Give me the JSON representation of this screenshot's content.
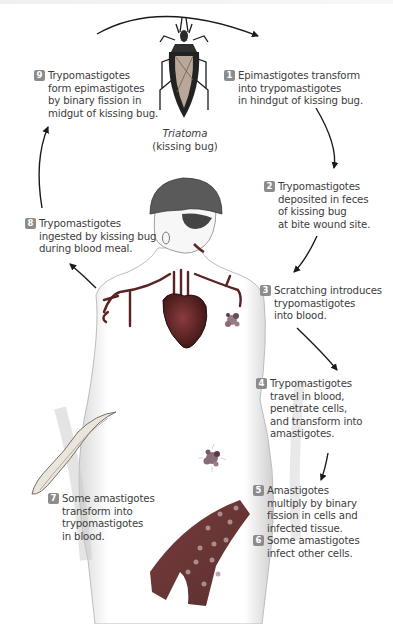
{
  "diagram": {
    "badge_color": "#8c8c8c",
    "arrow_color": "#1a1a1a",
    "bug_caption": {
      "genus": "Triatoma",
      "common_name": "(kissing bug)"
    },
    "steps": [
      {
        "number": "1",
        "lines": [
          "Epimastigotes transform",
          "into trypomastigotes",
          "in hindgut of kissing bug."
        ]
      },
      {
        "number": "2",
        "lines": [
          "Trypomastigotes",
          "deposited in feces",
          "of kissing bug",
          "at bite wound site."
        ]
      },
      {
        "number": "3",
        "lines": [
          "Scratching introduces",
          "trypomastigotes",
          "into blood."
        ]
      },
      {
        "number": "4",
        "lines": [
          "Trypomastigotes",
          "travel in blood,",
          "penetrate cells,",
          "and transform into",
          "amastigotes."
        ]
      },
      {
        "number": "5",
        "lines": [
          "Amastigotes",
          "multiply by binary",
          "fission in cells and",
          "infected tissue."
        ]
      },
      {
        "number": "6",
        "lines": [
          "Some amastigotes",
          "infect other cells."
        ]
      },
      {
        "number": "7",
        "lines": [
          "Some amastigotes",
          "transform into",
          "trypomastigotes",
          "in blood."
        ]
      },
      {
        "number": "8",
        "lines": [
          "Trypomastigotes",
          "ingested by kissing bug",
          "during blood meal."
        ]
      },
      {
        "number": "9",
        "lines": [
          "Trypomastigotes",
          "form epimastigotes",
          "by binary fission in",
          "midgut of kissing bug."
        ]
      }
    ],
    "illustrations": [
      {
        "name": "kissing-bug",
        "label": "Triatoma"
      },
      {
        "name": "human-figure",
        "label": "human host"
      },
      {
        "name": "heart",
        "label": "heart"
      },
      {
        "name": "infected-tissue-chest",
        "label": "amastigote nest in chest"
      },
      {
        "name": "infected-tissue-abdomen",
        "label": "amastigote nest in abdomen"
      },
      {
        "name": "trypomastigote",
        "label": "trypomastigote"
      },
      {
        "name": "blood-vessel",
        "label": "infected blood vessel"
      }
    ]
  }
}
